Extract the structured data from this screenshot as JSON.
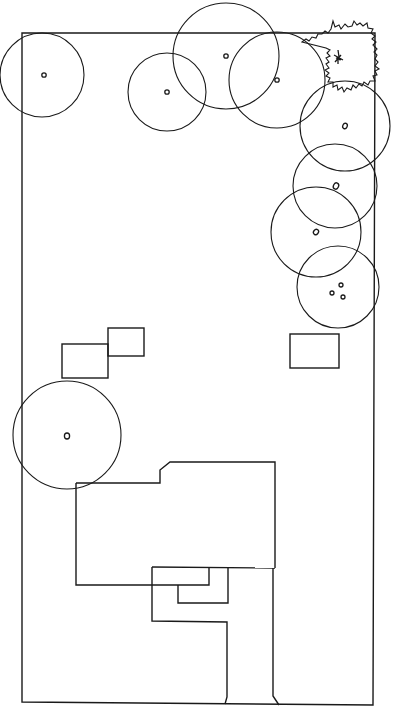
{
  "diagram": {
    "type": "site-plan",
    "stroke_color": "#1a1a1a",
    "background": "#ffffff",
    "property_boundary": {
      "points": [
        [
          22,
          33
        ],
        [
          375,
          33
        ],
        [
          373,
          705
        ],
        [
          22,
          702
        ]
      ]
    },
    "trees": [
      {
        "id": "tree-1",
        "cx": 42,
        "cy": 75,
        "r": 42,
        "trunk_r": 2.2
      },
      {
        "id": "tree-2",
        "cx": 167,
        "cy": 92,
        "r": 39,
        "trunk_r": 2.2
      },
      {
        "id": "tree-3",
        "cx": 226,
        "cy": 56,
        "r": 53,
        "trunk_r": 2.2
      },
      {
        "id": "tree-4",
        "cx": 277,
        "cy": 80,
        "r": 48,
        "trunk_r": 2.2
      },
      {
        "id": "tree-5",
        "cx": 345,
        "cy": 126,
        "r": 45,
        "trunk_r": 2.2
      },
      {
        "id": "tree-6",
        "cx": 335,
        "cy": 186,
        "r": 42,
        "trunk_r": 2.6
      },
      {
        "id": "tree-7",
        "cx": 316,
        "cy": 232,
        "r": 45,
        "trunk_r": 2.2
      },
      {
        "id": "tree-8",
        "cx": 338,
        "cy": 287,
        "r": 41,
        "trunk_multi": [
          [
            331,
            293
          ],
          [
            341,
            286
          ],
          [
            343,
            297
          ]
        ]
      },
      {
        "id": "tree-9",
        "cx": 67,
        "cy": 435,
        "r": 54,
        "trunk_r": 2.4
      }
    ],
    "shrub": {
      "id": "spiky-shrub",
      "cx": 338,
      "cy": 58
    },
    "sheds": [
      {
        "id": "shed-left",
        "x": 62,
        "y": 344,
        "w": 46,
        "h": 34
      },
      {
        "id": "shed-left-upper",
        "x": 108,
        "y": 328,
        "w": 36,
        "h": 28
      },
      {
        "id": "shed-right",
        "x": 290,
        "y": 334,
        "w": 49,
        "h": 34
      }
    ],
    "house": {
      "outline": [
        [
          76,
          483
        ],
        [
          160,
          483
        ],
        [
          160,
          470
        ],
        [
          170,
          462
        ],
        [
          275,
          462
        ],
        [
          275,
          568
        ]
      ],
      "wing": [
        [
          76,
          483
        ],
        [
          76,
          585
        ],
        [
          209,
          585
        ],
        [
          209,
          567
        ]
      ]
    }
  }
}
